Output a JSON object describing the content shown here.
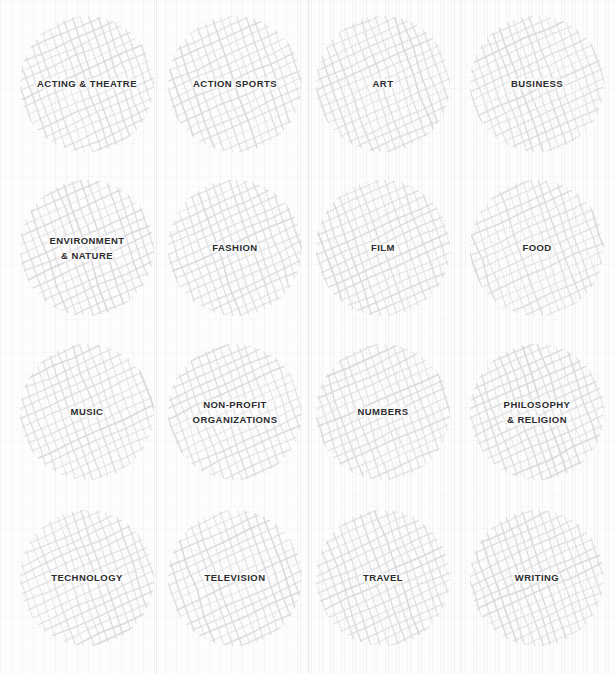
{
  "page": {
    "background_color": "#fdfdfd",
    "hatch_color": "#d6d6dc",
    "label_color": "#2b2b2e",
    "grid_columns": 4,
    "grid_rows": 4
  },
  "categories": [
    {
      "label": "ACTING & THEATRE",
      "name": "acting-and-theatre",
      "row": 1,
      "col": 1
    },
    {
      "label": "ACTION SPORTS",
      "name": "action-sports",
      "row": 1,
      "col": 2
    },
    {
      "label": "ART",
      "name": "art",
      "row": 1,
      "col": 3
    },
    {
      "label": "BUSINESS",
      "name": "business",
      "row": 1,
      "col": 4
    },
    {
      "label": "ENVIRONMENT\n& NATURE",
      "name": "environment-and-nature",
      "row": 2,
      "col": 1
    },
    {
      "label": "FASHION",
      "name": "fashion",
      "row": 2,
      "col": 2
    },
    {
      "label": "FILM",
      "name": "film",
      "row": 2,
      "col": 3
    },
    {
      "label": "FOOD",
      "name": "food",
      "row": 2,
      "col": 4
    },
    {
      "label": "MUSIC",
      "name": "music",
      "row": 3,
      "col": 1
    },
    {
      "label": "NON-PROFIT\nORGANIZATIONS",
      "name": "non-profit-organizations",
      "row": 3,
      "col": 2
    },
    {
      "label": "NUMBERS",
      "name": "numbers",
      "row": 3,
      "col": 3
    },
    {
      "label": "PHILOSOPHY\n& RELIGION",
      "name": "philosophy-and-religion",
      "row": 3,
      "col": 4
    },
    {
      "label": "TECHNOLOGY",
      "name": "technology",
      "row": 4,
      "col": 1
    },
    {
      "label": "TELEVISION",
      "name": "television",
      "row": 4,
      "col": 2
    },
    {
      "label": "TRAVEL",
      "name": "travel",
      "row": 4,
      "col": 3
    },
    {
      "label": "WRITING",
      "name": "writing",
      "row": 4,
      "col": 4
    }
  ]
}
